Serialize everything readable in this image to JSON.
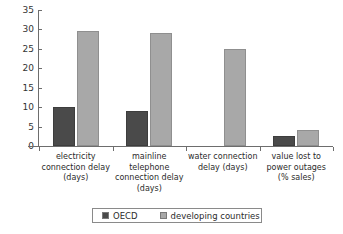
{
  "chart_data": {
    "type": "bar",
    "title": "",
    "xlabel": "",
    "ylabel": "",
    "ylim": [
      0,
      35
    ],
    "ytick_values": [
      0,
      5,
      10,
      15,
      20,
      25,
      30,
      35
    ],
    "ytick_labels": [
      "0",
      "5",
      "10",
      "15",
      "20",
      "25",
      "30",
      "35"
    ],
    "grid": false,
    "legend_position": "bottom",
    "categories": [
      "electricity connection delay (days)",
      "mainline telephone connection delay (days)",
      "water connection delay (days)",
      "value lost to power outages (% sales)"
    ],
    "category_lines": [
      [
        "electricity",
        "connection delay",
        "(days)"
      ],
      [
        "mainline",
        "telephone",
        "connection delay",
        "(days)"
      ],
      [
        "water connection",
        "delay (days)"
      ],
      [
        "value lost to",
        "power outages",
        "(% sales)"
      ]
    ],
    "series": [
      {
        "name": "OECD",
        "color": "#4a4a4a",
        "values": [
          10,
          9,
          null,
          2.5
        ]
      },
      {
        "name": "developing countries",
        "color": "#a8a8a8",
        "values": [
          29.5,
          29,
          25,
          4
        ]
      }
    ]
  },
  "legend": {
    "items": [
      {
        "label": "OECD",
        "color": "#4a4a4a"
      },
      {
        "label": "developing countries",
        "color": "#a8a8a8"
      }
    ]
  },
  "axis": {
    "line_color": "#6d6d6d"
  }
}
